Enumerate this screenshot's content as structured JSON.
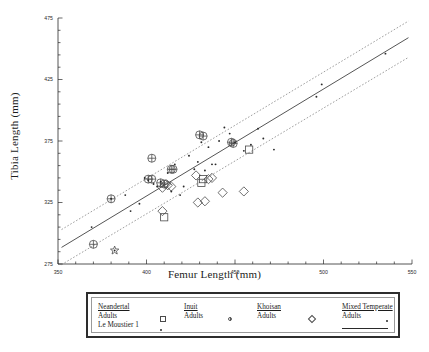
{
  "chart_data": {
    "type": "scatter",
    "title": "",
    "xlabel": "Femur Length (mm)",
    "ylabel": "Tibia Length (mm)",
    "xlim": [
      350,
      550
    ],
    "ylim": [
      275,
      475
    ],
    "xticks": [
      350,
      400,
      450,
      500,
      550
    ],
    "yticks": [
      275,
      325,
      375,
      425,
      475
    ],
    "grid": false,
    "legend_position": "below-plot",
    "series": [
      {
        "name": "Neandertal Adults",
        "marker": "open-square",
        "points": [
          [
            410,
            313
          ],
          [
            431,
            341
          ],
          [
            432,
            344
          ],
          [
            458,
            368
          ]
        ]
      },
      {
        "name": "Neandertal Le Moustier 1",
        "marker": "small-dot",
        "points": [
          [
            382,
            286
          ]
        ]
      },
      {
        "name": "Inuit Adults",
        "marker": "circled-plus",
        "points": [
          [
            370,
            291
          ],
          [
            380,
            328
          ],
          [
            403,
            361
          ],
          [
            401,
            344
          ],
          [
            403,
            344
          ],
          [
            408,
            341
          ],
          [
            410,
            340
          ],
          [
            414,
            352
          ],
          [
            415,
            352
          ],
          [
            430,
            380
          ],
          [
            432,
            379
          ],
          [
            448,
            374
          ],
          [
            449,
            373
          ]
        ]
      },
      {
        "name": "Khoisan Adults",
        "marker": "open-diamond",
        "points": [
          [
            409,
            318
          ],
          [
            411,
            340
          ],
          [
            412,
            339
          ],
          [
            414,
            338
          ],
          [
            428,
            347
          ],
          [
            429,
            325
          ],
          [
            433,
            326
          ],
          [
            435,
            344
          ],
          [
            437,
            345
          ],
          [
            443,
            333
          ],
          [
            455,
            334
          ],
          [
            409,
            337
          ]
        ]
      },
      {
        "name": "Mixed Temperate Adults",
        "marker": "small-dot",
        "points": [
          [
            369,
            305
          ],
          [
            380,
            328
          ],
          [
            388,
            331
          ],
          [
            391,
            318
          ],
          [
            396,
            324
          ],
          [
            399,
            345
          ],
          [
            401,
            343
          ],
          [
            404,
            340
          ],
          [
            406,
            338
          ],
          [
            408,
            342
          ],
          [
            412,
            349
          ],
          [
            414,
            334
          ],
          [
            416,
            356
          ],
          [
            419,
            331
          ],
          [
            421,
            338
          ],
          [
            424,
            363
          ],
          [
            427,
            352
          ],
          [
            429,
            358
          ],
          [
            431,
            374
          ],
          [
            433,
            351
          ],
          [
            435,
            370
          ],
          [
            437,
            356
          ],
          [
            439,
            356
          ],
          [
            441,
            375
          ],
          [
            444,
            386
          ],
          [
            447,
            381
          ],
          [
            450,
            374
          ],
          [
            455,
            367
          ],
          [
            459,
            372
          ],
          [
            463,
            385
          ],
          [
            466,
            377
          ],
          [
            472,
            368
          ],
          [
            496,
            411
          ],
          [
            499,
            421
          ],
          [
            535,
            446
          ]
        ]
      }
    ],
    "fit_line": {
      "name": "Mixed Temperate regression",
      "style": "solid",
      "x": [
        352,
        548
      ],
      "y": [
        288.5,
        459.0
      ]
    },
    "prediction_bands": [
      {
        "name": "upper band",
        "style": "dashed",
        "x": [
          352,
          548
        ],
        "y": [
          303.0,
          472.5
        ]
      },
      {
        "name": "lower band",
        "style": "dashed",
        "x": [
          352,
          548
        ],
        "y": [
          274.5,
          443.0
        ]
      }
    ]
  },
  "axes": {
    "x_title": "Femur Length (mm)",
    "y_title": "Tibia Length (mm)",
    "x_tick_labels": [
      "350",
      "400",
      "450",
      "500",
      "550"
    ],
    "y_tick_labels": [
      "275",
      "325",
      "375",
      "425",
      "475"
    ]
  },
  "legend": {
    "columns": [
      {
        "header": "Neandertal",
        "rows": [
          {
            "label": "Adults",
            "marker": "open-square"
          },
          {
            "label": "Le Moustier 1",
            "marker": "small-dot"
          }
        ]
      },
      {
        "header": "Inuit",
        "rows": [
          {
            "label": "Adults",
            "marker": "circled-plus"
          }
        ]
      },
      {
        "header": "Khoisan",
        "rows": [
          {
            "label": "Adults",
            "marker": "open-diamond"
          }
        ]
      },
      {
        "header": "Mixed Temperate",
        "rows": [
          {
            "label": "Adults",
            "marker": "small-dot"
          }
        ],
        "line_sample": true
      }
    ]
  },
  "colors": {
    "axis": "#2a2a2a",
    "marker_outline": "#4a4a4a",
    "fit_line": "#2a2a2a",
    "band_line": "#7d7d7d",
    "legend_border": "#2d2d2d",
    "background": "#ffffff"
  }
}
